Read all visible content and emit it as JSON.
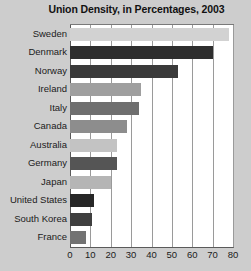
{
  "chart_data": {
    "type": "bar",
    "orientation": "horizontal",
    "title": "Union Density, in Percentages, 2003",
    "xlabel": "",
    "ylabel": "",
    "xlim": [
      0,
      80
    ],
    "xticks": [
      0,
      10,
      20,
      30,
      40,
      50,
      60,
      70,
      80
    ],
    "grid": true,
    "legend": false,
    "categories": [
      "Sweden",
      "Denmark",
      "Norway",
      "Ireland",
      "Italy",
      "Canada",
      "Australia",
      "Germany",
      "Japan",
      "United States",
      "South Korea",
      "France"
    ],
    "values": [
      78,
      70,
      53,
      35,
      34,
      28,
      23,
      23,
      20,
      12,
      11,
      8
    ],
    "bar_colors": [
      "#d2d2d2",
      "#2e2e2e",
      "#3a3a3a",
      "#9f9f9f",
      "#6f6f6f",
      "#8d8d8d",
      "#c3c3c3",
      "#555555",
      "#b5b5b5",
      "#272727",
      "#3f3f3f",
      "#737373"
    ]
  },
  "style": {
    "figure_background": "#cdcdcd",
    "plot_background": "#ffffff",
    "gridline_color": "#9a9a9a",
    "axis_color": "#5a5a5a",
    "text_color": "#1b1b1b"
  }
}
